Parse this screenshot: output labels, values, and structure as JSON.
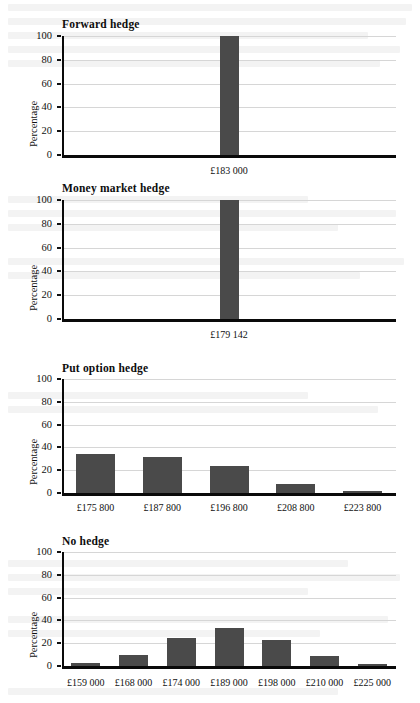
{
  "chart_data": [
    {
      "type": "bar",
      "title": "Forward hedge",
      "ylabel": "Percentage",
      "xlabel": "",
      "categories": [
        "£183 000"
      ],
      "values": [
        100
      ],
      "ylim": [
        0,
        100
      ],
      "yticks": [
        0,
        20,
        40,
        60,
        80,
        100
      ],
      "grid": true,
      "legend": "none",
      "bar_color": "#4a4a4a"
    },
    {
      "type": "bar",
      "title": "Money market hedge",
      "ylabel": "Percentage",
      "xlabel": "",
      "categories": [
        "£179 142"
      ],
      "values": [
        100
      ],
      "ylim": [
        0,
        100
      ],
      "yticks": [
        0,
        20,
        40,
        60,
        80,
        100
      ],
      "grid": true,
      "legend": "none",
      "bar_color": "#4a4a4a"
    },
    {
      "type": "bar",
      "title": "Put option hedge",
      "ylabel": "Percentage",
      "xlabel": "",
      "categories": [
        "£175 800",
        "£187 800",
        "£196 800",
        "£208 800",
        "£223 800"
      ],
      "values": [
        34,
        32,
        24,
        8,
        1.5
      ],
      "ylim": [
        0,
        100
      ],
      "yticks": [
        0,
        20,
        40,
        60,
        80,
        100
      ],
      "grid": true,
      "legend": "none",
      "bar_color": "#4a4a4a"
    },
    {
      "type": "bar",
      "title": "No hedge",
      "ylabel": "Percentage",
      "xlabel": "",
      "categories": [
        "£159 000",
        "£168 000",
        "£174 000",
        "£189 000",
        "£198 000",
        "£210 000",
        "£225 000"
      ],
      "values": [
        2.5,
        9.5,
        25,
        33,
        23,
        8.5,
        2
      ],
      "ylim": [
        0,
        100
      ],
      "yticks": [
        0,
        20,
        40,
        60,
        80,
        100
      ],
      "grid": true,
      "legend": "none",
      "bar_color": "#4a4a4a"
    }
  ],
  "figure": {
    "panel_count": 4
  }
}
